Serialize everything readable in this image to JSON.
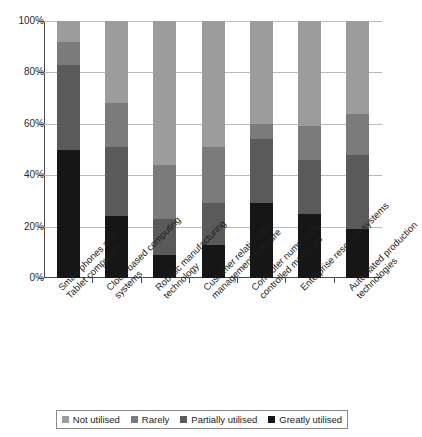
{
  "chart_data": {
    "type": "bar",
    "subtype": "stacked-percentage-column",
    "title": "",
    "subtitle": "",
    "xlabel": "",
    "ylabel": "",
    "ylim": [
      0,
      100
    ],
    "yunit": "%",
    "grid": true,
    "legend_position": "bottom",
    "ytick_labels": [
      "0%",
      "20%",
      "40%",
      "60%",
      "80%",
      "100%"
    ],
    "ytick_values": [
      0,
      20,
      40,
      60,
      80,
      100
    ],
    "categories": [
      "Smart phones and Tablet computers",
      "Cloud-based computing systems",
      "Robotic manufacturing technology",
      "Customer relationship management software",
      "Computer numerically controlled machines",
      "Enterprise resource systems",
      "Automated production technologies"
    ],
    "category_lines": [
      [
        "Smart phones and",
        "Tablet computers"
      ],
      [
        "Cloud-based computing",
        "systems"
      ],
      [
        "Robotic manufacturing",
        "technology"
      ],
      [
        "Customer relationship",
        "management software"
      ],
      [
        "Computer numerically",
        "controlled machines"
      ],
      [
        "Enterprise resource systems"
      ],
      [
        "Automated production",
        "technologies"
      ]
    ],
    "series": [
      {
        "name": "Greatly utilised",
        "color": "#161616",
        "values": [
          50,
          24,
          9,
          13,
          29,
          25,
          19
        ]
      },
      {
        "name": "Partially utilised",
        "color": "#5a5a5a",
        "values": [
          33,
          27,
          14,
          16,
          25,
          21,
          29
        ]
      },
      {
        "name": "Rarely",
        "color": "#7b7b7b",
        "values": [
          9,
          17,
          21,
          22,
          6,
          13,
          16
        ]
      },
      {
        "name": "Not utilised",
        "color": "#9c9c9c",
        "values": [
          8,
          32,
          56,
          49,
          40,
          41,
          36
        ]
      }
    ],
    "stack_order_bottom_to_top": [
      "Greatly utilised",
      "Partially utilised",
      "Rarely",
      "Not utilised"
    ],
    "legend_entries": [
      {
        "label": "Not utilised",
        "color": "#9c9c9c"
      },
      {
        "label": "Rarely",
        "color": "#7b7b7b"
      },
      {
        "label": "Partially utilised",
        "color": "#5a5a5a"
      },
      {
        "label": "Greatly utilised",
        "color": "#161616"
      }
    ],
    "cumulative_tops": [
      [
        50,
        83,
        92,
        100
      ],
      [
        24,
        51,
        68,
        100
      ],
      [
        9,
        23,
        44,
        100
      ],
      [
        13,
        29,
        51,
        100
      ],
      [
        29,
        54,
        60,
        100
      ],
      [
        25,
        46,
        59,
        100
      ],
      [
        19,
        48,
        64,
        100
      ]
    ]
  },
  "axis": {
    "grid_color": "#b9b9b9",
    "axis_color": "#4a4a4a"
  }
}
